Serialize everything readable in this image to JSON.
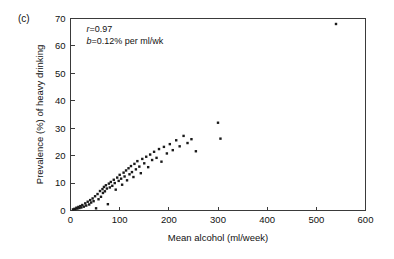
{
  "panel": {
    "label": "(c)"
  },
  "chart_data": {
    "type": "scatter",
    "title": "",
    "xlabel": "Mean alcohol (ml/week)",
    "ylabel": "Prevalence (%) of heavy drinking",
    "xlim": [
      0,
      600
    ],
    "ylim": [
      0,
      70
    ],
    "xticks": [
      0,
      100,
      200,
      300,
      400,
      500,
      600
    ],
    "yticks": [
      0,
      10,
      20,
      30,
      40,
      50,
      60,
      70
    ],
    "grid": false,
    "legend": null,
    "annotations": [
      "r=0.97",
      "b=0.12% per ml/wk"
    ],
    "annotation_parts": [
      {
        "symbol": "r",
        "rest": "=0.97"
      },
      {
        "symbol": "b",
        "rest": "=0.12% per ml/wk"
      }
    ],
    "marker": {
      "shape": "square",
      "color": "#1a1a1a",
      "size": 2.4
    },
    "points": [
      [
        5,
        0.4
      ],
      [
        8,
        0.6
      ],
      [
        10,
        0.5
      ],
      [
        12,
        1.0
      ],
      [
        14,
        0.7
      ],
      [
        16,
        1.3
      ],
      [
        18,
        0.9
      ],
      [
        20,
        1.6
      ],
      [
        22,
        1.1
      ],
      [
        24,
        2.0
      ],
      [
        27,
        1.4
      ],
      [
        30,
        2.6
      ],
      [
        32,
        1.8
      ],
      [
        35,
        3.2
      ],
      [
        38,
        2.2
      ],
      [
        40,
        3.8
      ],
      [
        42,
        2.9
      ],
      [
        45,
        4.4
      ],
      [
        47,
        3.4
      ],
      [
        50,
        5.2
      ],
      [
        52,
        0.8
      ],
      [
        55,
        6.0
      ],
      [
        57,
        4.1
      ],
      [
        60,
        7.1
      ],
      [
        62,
        5.0
      ],
      [
        65,
        7.8
      ],
      [
        66,
        6.4
      ],
      [
        68,
        8.6
      ],
      [
        70,
        7.0
      ],
      [
        72,
        9.2
      ],
      [
        74,
        8.0
      ],
      [
        76,
        2.3
      ],
      [
        78,
        9.8
      ],
      [
        80,
        8.4
      ],
      [
        82,
        10.4
      ],
      [
        85,
        9.0
      ],
      [
        88,
        11.2
      ],
      [
        90,
        10.0
      ],
      [
        92,
        7.6
      ],
      [
        95,
        12.0
      ],
      [
        98,
        10.8
      ],
      [
        100,
        13.0
      ],
      [
        103,
        11.6
      ],
      [
        105,
        9.4
      ],
      [
        108,
        13.8
      ],
      [
        110,
        12.4
      ],
      [
        113,
        14.6
      ],
      [
        115,
        11.0
      ],
      [
        118,
        15.4
      ],
      [
        120,
        13.2
      ],
      [
        123,
        16.2
      ],
      [
        125,
        14.0
      ],
      [
        128,
        12.2
      ],
      [
        130,
        17.0
      ],
      [
        133,
        15.0
      ],
      [
        136,
        18.0
      ],
      [
        140,
        16.0
      ],
      [
        143,
        13.6
      ],
      [
        146,
        18.8
      ],
      [
        150,
        17.2
      ],
      [
        154,
        19.6
      ],
      [
        158,
        15.8
      ],
      [
        162,
        20.4
      ],
      [
        166,
        18.4
      ],
      [
        170,
        21.4
      ],
      [
        175,
        19.2
      ],
      [
        180,
        22.4
      ],
      [
        185,
        17.8
      ],
      [
        190,
        23.2
      ],
      [
        196,
        20.8
      ],
      [
        202,
        24.2
      ],
      [
        208,
        22.0
      ],
      [
        215,
        25.6
      ],
      [
        222,
        23.4
      ],
      [
        230,
        27.2
      ],
      [
        238,
        24.6
      ],
      [
        246,
        26.0
      ],
      [
        255,
        21.6
      ],
      [
        300,
        32.0
      ],
      [
        305,
        26.2
      ],
      [
        540,
        68.0
      ]
    ]
  }
}
